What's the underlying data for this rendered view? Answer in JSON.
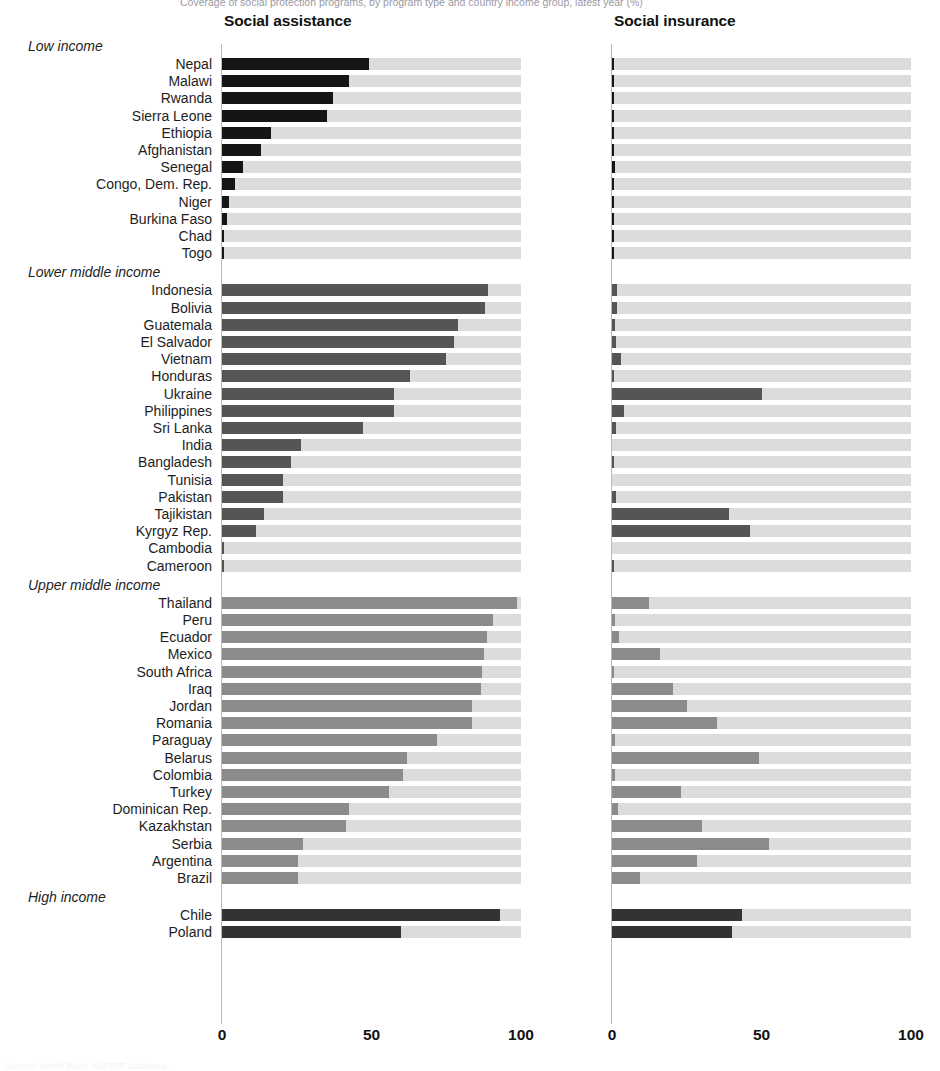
{
  "figure": {
    "top_caption": "Coverage of social protection programs, by program type and country income group, latest year (%)",
    "bottom_caption": "Source: World Bank ASPIRE database.",
    "panels": [
      {
        "key": "assistance",
        "title": "Social assistance"
      },
      {
        "key": "insurance",
        "title": "Social insurance"
      }
    ],
    "axis": {
      "ticks": [
        "0",
        "50",
        "100"
      ],
      "values": [
        0,
        50,
        100
      ],
      "min": 0,
      "max": 100
    },
    "group_labels": {
      "low": "Low income",
      "lower_middle": "Lower middle income",
      "upper_middle": "Upper middle income",
      "high": "High income"
    },
    "colors": {
      "track": "#dcdcdc",
      "low": "#151515",
      "lower_middle": "#555555",
      "upper_middle": "#8b8b8b",
      "high": "#333333",
      "baseline": "#b9b9b9"
    }
  },
  "chart_data": {
    "type": "bar",
    "title": "Coverage of social protection programs, by program type and country income group, latest year (%)",
    "xlabel": "",
    "ylabel": "",
    "xlim": [
      0,
      100
    ],
    "grid": false,
    "legend": "none",
    "orientation": "horizontal",
    "panels": [
      "Social assistance",
      "Social insurance"
    ],
    "groups": [
      {
        "name": "Low income",
        "key": "low",
        "rows": [
          {
            "country": "Nepal",
            "assistance": 49.0,
            "insurance": 0.8
          },
          {
            "country": "Malawi",
            "assistance": 42.5,
            "insurance": 0.7
          },
          {
            "country": "Rwanda",
            "assistance": 37.0,
            "insurance": 0.3
          },
          {
            "country": "Sierra Leone",
            "assistance": 35.0,
            "insurance": 0.2
          },
          {
            "country": "Ethiopia",
            "assistance": 16.5,
            "insurance": 0.1
          },
          {
            "country": "Afghanistan",
            "assistance": 13.0,
            "insurance": 0.1
          },
          {
            "country": "Senegal",
            "assistance": 7.0,
            "insurance": 1.0
          },
          {
            "country": "Congo, Dem. Rep.",
            "assistance": 4.5,
            "insurance": 0.8
          },
          {
            "country": "Niger",
            "assistance": 2.2,
            "insurance": 0.6
          },
          {
            "country": "Burkina Faso",
            "assistance": 1.6,
            "insurance": 0.7
          },
          {
            "country": "Chad",
            "assistance": 0.4,
            "insurance": 0.8
          },
          {
            "country": "Togo",
            "assistance": 0.3,
            "insurance": 0.2
          }
        ]
      },
      {
        "name": "Lower middle income",
        "key": "lower_middle",
        "rows": [
          {
            "country": "Indonesia",
            "assistance": 89.0,
            "insurance": 1.8
          },
          {
            "country": "Bolivia",
            "assistance": 88.0,
            "insurance": 1.8
          },
          {
            "country": "Guatemala",
            "assistance": 79.0,
            "insurance": 1.0
          },
          {
            "country": "El Salvador",
            "assistance": 77.5,
            "insurance": 1.4
          },
          {
            "country": "Vietnam",
            "assistance": 75.0,
            "insurance": 3.0
          },
          {
            "country": "Honduras",
            "assistance": 63.0,
            "insurance": 0.8
          },
          {
            "country": "Ukraine",
            "assistance": 57.5,
            "insurance": 50.0
          },
          {
            "country": "Philippines",
            "assistance": 57.5,
            "insurance": 4.0
          },
          {
            "country": "Sri Lanka",
            "assistance": 47.0,
            "insurance": 1.5
          },
          {
            "country": "India",
            "assistance": 26.5,
            "insurance": 0.0
          },
          {
            "country": "Bangladesh",
            "assistance": 23.0,
            "insurance": 0.4
          },
          {
            "country": "Tunisia",
            "assistance": 20.5,
            "insurance": 0.0
          },
          {
            "country": "Pakistan",
            "assistance": 20.5,
            "insurance": 1.2
          },
          {
            "country": "Tajikistan",
            "assistance": 14.0,
            "insurance": 39.0
          },
          {
            "country": "Kyrgyz Rep.",
            "assistance": 11.5,
            "insurance": 46.0
          },
          {
            "country": "Cambodia",
            "assistance": 0.2,
            "insurance": 0.0
          },
          {
            "country": "Cameroon",
            "assistance": 0.2,
            "insurance": 0.8
          }
        ]
      },
      {
        "name": "Upper middle income",
        "key": "upper_middle",
        "rows": [
          {
            "country": "Thailand",
            "assistance": 98.5,
            "insurance": 12.5
          },
          {
            "country": "Peru",
            "assistance": 90.5,
            "insurance": 1.0
          },
          {
            "country": "Ecuador",
            "assistance": 88.5,
            "insurance": 2.2
          },
          {
            "country": "Mexico",
            "assistance": 87.5,
            "insurance": 16.0
          },
          {
            "country": "South Africa",
            "assistance": 87.0,
            "insurance": 0.8
          },
          {
            "country": "Iraq",
            "assistance": 86.5,
            "insurance": 20.5
          },
          {
            "country": "Jordan",
            "assistance": 83.5,
            "insurance": 25.0
          },
          {
            "country": "Romania",
            "assistance": 83.5,
            "insurance": 35.0
          },
          {
            "country": "Paraguay",
            "assistance": 72.0,
            "insurance": 1.0
          },
          {
            "country": "Belarus",
            "assistance": 62.0,
            "insurance": 49.0
          },
          {
            "country": "Colombia",
            "assistance": 60.5,
            "insurance": 1.0
          },
          {
            "country": "Turkey",
            "assistance": 56.0,
            "insurance": 23.0
          },
          {
            "country": "Dominican Rep.",
            "assistance": 42.5,
            "insurance": 2.0
          },
          {
            "country": "Kazakhstan",
            "assistance": 41.5,
            "insurance": 30.0
          },
          {
            "country": "Serbia",
            "assistance": 27.0,
            "insurance": 52.5
          },
          {
            "country": "Argentina",
            "assistance": 25.5,
            "insurance": 28.5
          },
          {
            "country": "Brazil",
            "assistance": 25.5,
            "insurance": 9.5
          }
        ]
      },
      {
        "name": "High income",
        "key": "high",
        "rows": [
          {
            "country": "Chile",
            "assistance": 93.0,
            "insurance": 43.5
          },
          {
            "country": "Poland",
            "assistance": 60.0,
            "insurance": 40.0
          }
        ]
      }
    ]
  }
}
